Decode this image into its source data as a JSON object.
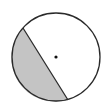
{
  "diagram": {
    "type": "circle-segment",
    "circle": {
      "cx": 56,
      "cy": 57,
      "r": 44
    },
    "chord": {
      "x1": 23,
      "y1": 28,
      "x2": 68,
      "y2": 100
    },
    "center_dot": {
      "cx": 56,
      "cy": 57,
      "r": 1.6
    },
    "colors": {
      "stroke": "#2a2a2a",
      "shade": "#c4c4c4",
      "background": "#ffffff",
      "dot": "#111111"
    }
  }
}
